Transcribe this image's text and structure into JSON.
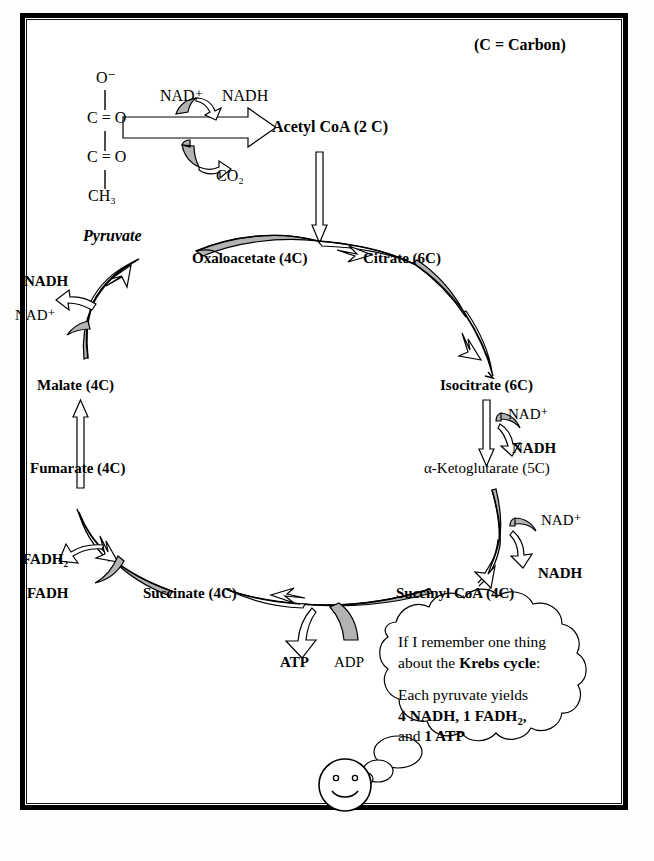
{
  "figure": {
    "legend_note": "(C = Carbon)",
    "colors": {
      "ink": "#000000",
      "arrow_fill_gray": "#b3b3b3",
      "arrow_fill_white": "#ffffff",
      "page_background": "#ffffff",
      "frame": "#000000"
    }
  },
  "pyruvate_structure": {
    "atoms": [
      "O⁻",
      "C = O",
      "C = O",
      "CH₃"
    ],
    "name": "Pyruvate"
  },
  "pyruvate_step": {
    "cofactor_in": "NAD⁺",
    "cofactor_out": "NADH",
    "byproduct": "CO₂",
    "product": "Acetyl CoA (2 C)"
  },
  "cycle_metabolites": [
    {
      "id": "oxaloacetate",
      "label": "Oxaloacetate (4C)",
      "carbons": 4,
      "bold": true
    },
    {
      "id": "citrate",
      "label": "Citrate (6C)",
      "carbons": 6,
      "bold": true
    },
    {
      "id": "isocitrate",
      "label": "Isocitrate (6C)",
      "carbons": 6,
      "bold": true
    },
    {
      "id": "alpha-ketoglutarate",
      "label": "α-Ketoglutarate (5C)",
      "carbons": 5,
      "bold": false
    },
    {
      "id": "succinyl-coa",
      "label": "Succinyl CoA (4C)",
      "carbons": 4,
      "bold": true
    },
    {
      "id": "succinate",
      "label": "Succinate (4C)",
      "carbons": 4,
      "bold": true
    },
    {
      "id": "fumarate",
      "label": "Fumarate (4C)",
      "carbons": 4,
      "bold": true
    },
    {
      "id": "malate",
      "label": "Malate (4C)",
      "carbons": 4,
      "bold": true
    }
  ],
  "cofactor_labels": {
    "isocitrate_step_in": "NAD⁺",
    "isocitrate_step_out": "NADH",
    "ketoglutarate_step_in": "NAD⁺",
    "ketoglutarate_step_out": "NADH",
    "succinate_step_in": "FADH",
    "succinate_step_out": "FADH₂",
    "malate_step_in": "NAD⁺",
    "malate_step_out": "NADH",
    "succinyl_step_in": "ADP",
    "succinyl_step_out": "ATP"
  },
  "thought_bubble": {
    "line1": "If I remember one thing",
    "line2_prefix": "about the ",
    "line2_bold": "Krebs cycle",
    "line2_suffix": ":",
    "line3": "Each pyruvate yields",
    "line4_bold": "4 NADH, 1 FADH₂,",
    "line5_prefix": "and ",
    "line5_bold": "1 ATP"
  },
  "character": {
    "name": "smiley-face",
    "expression": "smiling"
  }
}
